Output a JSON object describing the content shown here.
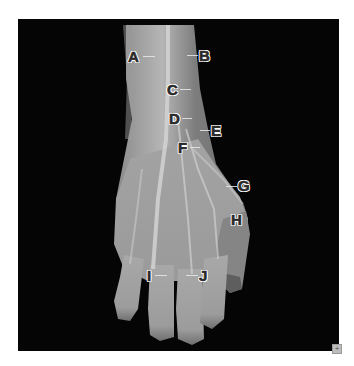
{
  "figure": {
    "background_color": "#050505",
    "page_color": "#ffffff",
    "labels": [
      {
        "id": "A",
        "text": "A"
      },
      {
        "id": "B",
        "text": "B"
      },
      {
        "id": "C",
        "text": "C"
      },
      {
        "id": "D",
        "text": "D"
      },
      {
        "id": "E",
        "text": "E"
      },
      {
        "id": "F",
        "text": "F"
      },
      {
        "id": "G",
        "text": "G"
      },
      {
        "id": "H",
        "text": "H"
      },
      {
        "id": "I",
        "text": "I"
      },
      {
        "id": "J",
        "text": "J"
      }
    ]
  },
  "controls": {
    "expand_icon": "plus-icon",
    "expand_glyph": "+"
  }
}
